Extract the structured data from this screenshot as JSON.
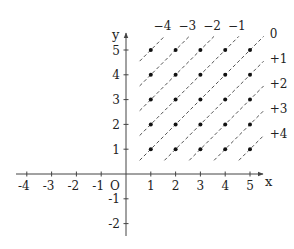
{
  "diagram": {
    "title": "",
    "origin_label": "O",
    "x_axis": {
      "name": "x",
      "ticks": [
        -4,
        -3,
        -2,
        -1,
        1,
        2,
        3,
        4,
        5
      ],
      "tick_labels": [
        "-4",
        "-3",
        "-2",
        "-1",
        "1",
        "2",
        "3",
        "4",
        "5"
      ]
    },
    "y_axis": {
      "name": "y",
      "ticks": [
        -2,
        -1,
        1,
        2,
        3,
        4,
        5
      ],
      "tick_labels": [
        "-2",
        "-1",
        "1",
        "2",
        "3",
        "4",
        "5"
      ]
    },
    "points": {
      "description": "lattice points (x, y) with x, y in {1,...,5}",
      "x_values": [
        1,
        2,
        3,
        4,
        5
      ],
      "y_values": [
        1,
        2,
        3,
        4,
        5
      ]
    },
    "dashed_lines": {
      "description": "lines x - y = k",
      "k_values": [
        -4,
        -3,
        -2,
        -1,
        0,
        1,
        2,
        3,
        4
      ],
      "labels": [
        "−4",
        "−3",
        "−2",
        "−1",
        "0",
        "+1",
        "+2",
        "+3",
        "+4"
      ]
    },
    "colors": {
      "ink": "#222222",
      "axis": "#444444",
      "dash": "#555555",
      "background": "#ffffff"
    }
  }
}
